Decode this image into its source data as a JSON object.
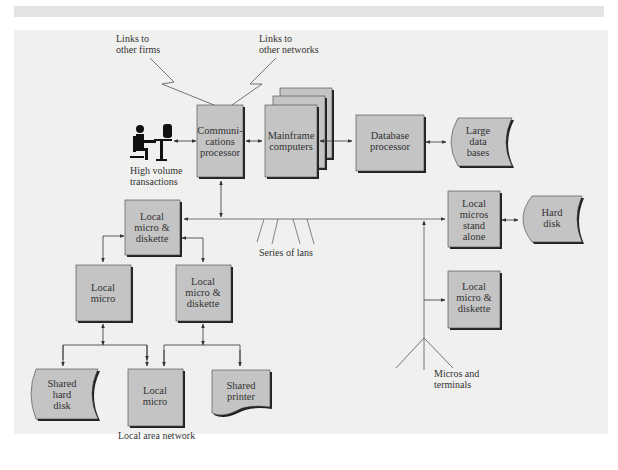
{
  "labels": {
    "links_firms": [
      "Links to",
      "other firms"
    ],
    "links_networks": [
      "Links to",
      "other networks"
    ],
    "high_volume": [
      "High volume",
      "transactions"
    ],
    "series_of_lans": "Series of lans",
    "micros_terminals": [
      "Micros and",
      "terminals"
    ],
    "lan_caption": "Local area network"
  },
  "nodes": {
    "comm_processor": [
      "Communi-",
      "cations",
      "processor"
    ],
    "mainframe": [
      "Mainframe",
      "computers"
    ],
    "db_processor": [
      "Database",
      "processor"
    ],
    "large_db": [
      "Large",
      "data",
      "bases"
    ],
    "local_micro_diskette_top": [
      "Local",
      "micro &",
      "diskette"
    ],
    "local_micros_standalone": [
      "Local",
      "micros",
      "stand",
      "alone"
    ],
    "hard_disk": [
      "Hard",
      "disk"
    ],
    "local_micro_left": [
      "Local",
      "micro"
    ],
    "local_micro_diskette_mid": [
      "Local",
      "micro &",
      "diskette"
    ],
    "local_micro_diskette_right": [
      "Local",
      "micro &",
      "diskette"
    ],
    "shared_hard_disk": [
      "Shared",
      "hard",
      "disk"
    ],
    "local_micro_bottom": [
      "Local",
      "micro"
    ],
    "shared_printer": [
      "Shared",
      "printer"
    ]
  },
  "colors": {
    "box_fill": "#c4c4c4",
    "box_shadow": "#222222",
    "line": "#555555",
    "panel": "#f0f0ef"
  }
}
